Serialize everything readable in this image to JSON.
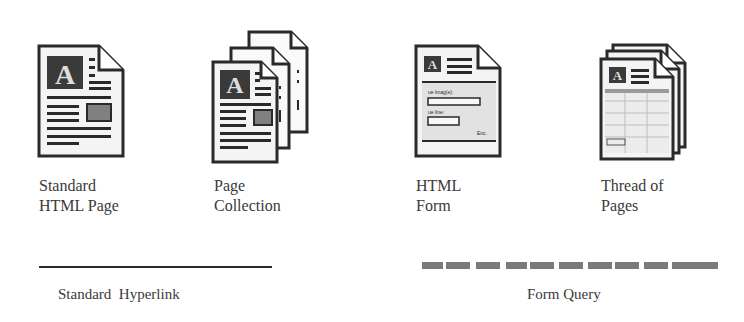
{
  "icons": [
    {
      "id": "standard-html-page",
      "label_line1": "Standard",
      "label_line2": "HTML Page"
    },
    {
      "id": "page-collection",
      "label_line1": "Page",
      "label_line2": "Collection"
    },
    {
      "id": "html-form",
      "label_line1": "HTML",
      "label_line2": "Form",
      "form_field1": "ue lmag(e):",
      "form_field2": "ue line:",
      "form_button": "Enc."
    },
    {
      "id": "thread-of-pages",
      "label_line1": "Thread of",
      "label_line2": "Pages"
    }
  ],
  "legend": {
    "standard_hyperlink": "Standard  Hyperlink",
    "form_query": "Form Query"
  },
  "colors": {
    "stroke": "#2a2a2a",
    "page_fill": "#f4f4f4",
    "block": "#3a3a3a",
    "accent_gray": "#808080",
    "dash": "#7a7a7a"
  }
}
